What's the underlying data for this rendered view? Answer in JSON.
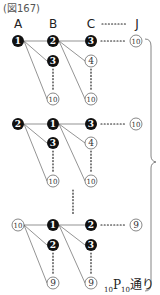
{
  "figure": {
    "title": "(図167)",
    "headers": [
      {
        "label": "A",
        "x": 18
      },
      {
        "label": "B",
        "x": 53
      },
      {
        "label": "C",
        "x": 91
      },
      {
        "label": "J",
        "x": 137
      }
    ],
    "header_dots": "……",
    "blocks": [
      {
        "root": {
          "label": "1",
          "style": "filled",
          "x": 18,
          "y": 41
        },
        "children": [
          {
            "label": "2",
            "style": "filled",
            "x": 53,
            "y": 41
          },
          {
            "label": "3",
            "style": "filled",
            "x": 53,
            "y": 61
          },
          {
            "label": "10",
            "style": "outline",
            "x": 53,
            "y": 99
          }
        ],
        "grandchildren": [
          {
            "label": "3",
            "style": "filled",
            "x": 91,
            "y": 41
          },
          {
            "label": "4",
            "style": "outline",
            "x": 91,
            "y": 61
          },
          {
            "label": "10",
            "style": "outline",
            "x": 91,
            "y": 99
          }
        ],
        "end": {
          "label": "10",
          "style": "outline",
          "x": 136,
          "y": 41
        }
      },
      {
        "root": {
          "label": "2",
          "style": "filled",
          "x": 18,
          "y": 124
        },
        "children": [
          {
            "label": "1",
            "style": "filled",
            "x": 53,
            "y": 124
          },
          {
            "label": "3",
            "style": "filled",
            "x": 53,
            "y": 143
          },
          {
            "label": "10",
            "style": "outline",
            "x": 53,
            "y": 181
          }
        ],
        "grandchildren": [
          {
            "label": "3",
            "style": "filled",
            "x": 91,
            "y": 124
          },
          {
            "label": "4",
            "style": "outline",
            "x": 91,
            "y": 143
          },
          {
            "label": "10",
            "style": "outline",
            "x": 91,
            "y": 181
          }
        ],
        "end": {
          "label": "10",
          "style": "outline",
          "x": 136,
          "y": 124
        }
      },
      {
        "root": {
          "label": "10",
          "style": "outline",
          "x": 18,
          "y": 225
        },
        "children": [
          {
            "label": "1",
            "style": "filled",
            "x": 53,
            "y": 225
          },
          {
            "label": "2",
            "style": "filled",
            "x": 53,
            "y": 245
          },
          {
            "label": "9",
            "style": "outline",
            "x": 53,
            "y": 283
          }
        ],
        "grandchildren": [
          {
            "label": "2",
            "style": "filled",
            "x": 91,
            "y": 225
          },
          {
            "label": "3",
            "style": "filled",
            "x": 91,
            "y": 245
          },
          {
            "label": "9",
            "style": "outline",
            "x": 91,
            "y": 283
          }
        ],
        "end": {
          "label": "9",
          "style": "outline",
          "x": 136,
          "y": 225
        }
      }
    ],
    "result_label": {
      "pre_sub": "10",
      "main": "P",
      "post_sub": "10",
      "suffix": "通り"
    }
  }
}
